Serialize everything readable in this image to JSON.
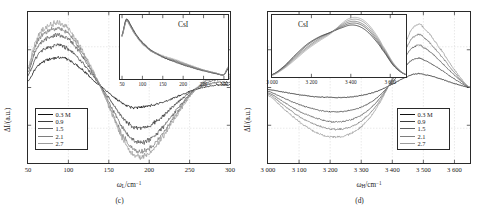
{
  "figure": {
    "panels": [
      {
        "id": "c",
        "caption": "(c)",
        "xlabel_symbol": "ω",
        "xlabel_sub": "L",
        "xlabel_unit": "/cm",
        "xlabel_sup": "−1",
        "ylabel": "ΔI/(a.u.)",
        "xticks": [
          "50",
          "100",
          "150",
          "200",
          "250",
          "300"
        ],
        "xtick_values": [
          50,
          100,
          150,
          200,
          250,
          300
        ],
        "xlim": [
          50,
          300
        ],
        "ylim": [
          -1.15,
          1.15
        ],
        "inset": {
          "title": "CsI",
          "xticks": [
            "50",
            "100",
            "150",
            "200",
            "250",
            "300"
          ],
          "xtick_values": [
            50,
            100,
            150,
            200,
            250,
            300
          ],
          "xlim": [
            45,
            310
          ],
          "ylim": [
            0,
            1.05
          ]
        },
        "legend": {
          "items": [
            {
              "label": "0.3 M",
              "color": "#111111"
            },
            {
              "label": "0.9",
              "color": "#3c3c3c"
            },
            {
              "label": "1.5",
              "color": "#5e5e5e"
            },
            {
              "label": "2.1",
              "color": "#7e7e7e"
            },
            {
              "label": "2.7",
              "color": "#9d9d9d"
            }
          ]
        }
      },
      {
        "id": "d",
        "caption": "(d)",
        "xlabel_symbol": "ω",
        "xlabel_sub": "H",
        "xlabel_unit": "/cm",
        "xlabel_sup": "−1",
        "ylabel": "ΔI/(a.u.)",
        "xticks": [
          "3 000",
          "3 100",
          "3 200",
          "3 300",
          "3 400",
          "3 500",
          "3 600"
        ],
        "xtick_values": [
          3000,
          3100,
          3200,
          3300,
          3400,
          3500,
          3600
        ],
        "xlim": [
          3000,
          3650
        ],
        "ylim": [
          -1.15,
          1.15
        ],
        "inset": {
          "title": "CsI",
          "xticks": [
            "3 000",
            "3 200",
            "3 400",
            "3 600"
          ],
          "xtick_values": [
            3000,
            3200,
            3400,
            3600
          ],
          "xlim": [
            3000,
            3680
          ],
          "ylim": [
            0,
            1.05
          ]
        },
        "legend": {
          "items": [
            {
              "label": "0.3 M",
              "color": "#111111"
            },
            {
              "label": "0.9",
              "color": "#3c3c3c"
            },
            {
              "label": "1.5",
              "color": "#5e5e5e"
            },
            {
              "label": "2.1",
              "color": "#7e7e7e"
            },
            {
              "label": "2.7",
              "color": "#9d9d9d"
            }
          ]
        }
      }
    ]
  },
  "chart_data": [
    {
      "type": "line",
      "panel": "c",
      "title": "",
      "xlabel": "ω_L/cm−1",
      "ylabel": "ΔI/(a.u.)",
      "xlim": [
        50,
        300
      ],
      "ylim": [
        -1.15,
        1.15
      ],
      "grid": true,
      "legend_position": "lower-left",
      "noise_amplitude": 0.035,
      "x": [
        50,
        60,
        70,
        80,
        90,
        100,
        110,
        120,
        130,
        140,
        150,
        160,
        170,
        180,
        190,
        200,
        210,
        220,
        230,
        240,
        250,
        260,
        270,
        280,
        290,
        300
      ],
      "series": [
        {
          "name": "0.3 M",
          "color": "#111111",
          "values": [
            0.1,
            0.3,
            0.4,
            0.44,
            0.46,
            0.42,
            0.34,
            0.24,
            0.12,
            0.02,
            -0.08,
            -0.18,
            -0.26,
            -0.31,
            -0.3,
            -0.28,
            -0.25,
            -0.21,
            -0.16,
            -0.11,
            -0.06,
            -0.02,
            0.01,
            0.03,
            0.04,
            0.04
          ]
        },
        {
          "name": "0.9",
          "color": "#3c3c3c",
          "values": [
            0.18,
            0.46,
            0.58,
            0.62,
            0.64,
            0.58,
            0.48,
            0.34,
            0.18,
            0.02,
            -0.16,
            -0.34,
            -0.5,
            -0.6,
            -0.62,
            -0.58,
            -0.5,
            -0.4,
            -0.29,
            -0.18,
            -0.08,
            -0.01,
            0.04,
            0.07,
            0.08,
            0.08
          ]
        },
        {
          "name": "1.5",
          "color": "#5e5e5e",
          "values": [
            0.24,
            0.58,
            0.72,
            0.78,
            0.8,
            0.73,
            0.6,
            0.42,
            0.22,
            0.02,
            -0.22,
            -0.46,
            -0.66,
            -0.8,
            -0.84,
            -0.8,
            -0.7,
            -0.56,
            -0.4,
            -0.25,
            -0.11,
            0.0,
            0.07,
            0.11,
            0.13,
            0.13
          ]
        },
        {
          "name": "2.1",
          "color": "#7e7e7e",
          "values": [
            0.28,
            0.66,
            0.82,
            0.88,
            0.9,
            0.82,
            0.67,
            0.47,
            0.24,
            0.01,
            -0.26,
            -0.54,
            -0.78,
            -0.94,
            -0.98,
            -0.93,
            -0.81,
            -0.65,
            -0.47,
            -0.29,
            -0.13,
            0.0,
            0.09,
            0.14,
            0.16,
            0.16
          ]
        },
        {
          "name": "2.7",
          "color": "#9d9d9d",
          "values": [
            0.32,
            0.72,
            0.9,
            0.96,
            0.98,
            0.89,
            0.73,
            0.51,
            0.26,
            0.01,
            -0.29,
            -0.59,
            -0.85,
            -1.02,
            -1.06,
            -1.0,
            -0.87,
            -0.7,
            -0.5,
            -0.31,
            -0.14,
            0.01,
            0.11,
            0.17,
            0.19,
            0.19
          ]
        }
      ],
      "inset": {
        "type": "line",
        "title": "CsI",
        "xlim": [
          45,
          310
        ],
        "ylim": [
          0,
          1.05
        ],
        "x": [
          50,
          60,
          70,
          80,
          90,
          100,
          120,
          140,
          160,
          180,
          200,
          220,
          240,
          260,
          280,
          300,
          310
        ],
        "series": [
          {
            "name": "0.3 M",
            "color": "#111111",
            "values": [
              0.72,
              0.98,
              0.9,
              0.78,
              0.68,
              0.6,
              0.48,
              0.4,
              0.33,
              0.28,
              0.23,
              0.19,
              0.15,
              0.12,
              0.09,
              0.07,
              0.16
            ]
          },
          {
            "name": "0.9",
            "color": "#3c3c3c",
            "values": [
              0.72,
              0.97,
              0.89,
              0.77,
              0.67,
              0.59,
              0.47,
              0.39,
              0.33,
              0.29,
              0.24,
              0.2,
              0.16,
              0.12,
              0.09,
              0.07,
              0.17
            ]
          },
          {
            "name": "1.5",
            "color": "#5e5e5e",
            "values": [
              0.71,
              0.96,
              0.88,
              0.76,
              0.66,
              0.58,
              0.47,
              0.4,
              0.34,
              0.3,
              0.25,
              0.21,
              0.16,
              0.13,
              0.09,
              0.07,
              0.18
            ]
          },
          {
            "name": "2.1",
            "color": "#7e7e7e",
            "values": [
              0.71,
              0.95,
              0.87,
              0.75,
              0.66,
              0.58,
              0.46,
              0.4,
              0.35,
              0.31,
              0.26,
              0.21,
              0.17,
              0.13,
              0.1,
              0.07,
              0.19
            ]
          },
          {
            "name": "2.7",
            "color": "#9d9d9d",
            "values": [
              0.7,
              0.94,
              0.86,
              0.75,
              0.65,
              0.57,
              0.46,
              0.41,
              0.36,
              0.32,
              0.27,
              0.22,
              0.17,
              0.13,
              0.1,
              0.07,
              0.2
            ]
          }
        ]
      }
    },
    {
      "type": "line",
      "panel": "d",
      "title": "",
      "xlabel": "ω_H/cm−1",
      "ylabel": "ΔI/(a.u.)",
      "xlim": [
        3000,
        3650
      ],
      "ylim": [
        -1.15,
        1.15
      ],
      "grid": true,
      "legend_position": "lower-right",
      "noise_amplitude": 0.012,
      "x": [
        3000,
        3050,
        3100,
        3150,
        3200,
        3250,
        3300,
        3350,
        3400,
        3450,
        3480,
        3500,
        3550,
        3600,
        3650
      ],
      "series": [
        {
          "name": "0.3 M",
          "color": "#111111",
          "values": [
            -0.03,
            -0.07,
            -0.11,
            -0.14,
            -0.15,
            -0.15,
            -0.12,
            -0.06,
            0.05,
            0.17,
            0.21,
            0.2,
            0.14,
            0.06,
            0.0
          ]
        },
        {
          "name": "0.9",
          "color": "#3c3c3c",
          "values": [
            -0.06,
            -0.16,
            -0.26,
            -0.33,
            -0.37,
            -0.36,
            -0.3,
            -0.16,
            0.08,
            0.36,
            0.44,
            0.42,
            0.29,
            0.13,
            0.0
          ]
        },
        {
          "name": "1.5",
          "color": "#5e5e5e",
          "values": [
            -0.08,
            -0.22,
            -0.36,
            -0.46,
            -0.52,
            -0.51,
            -0.42,
            -0.22,
            0.11,
            0.52,
            0.64,
            0.61,
            0.42,
            0.19,
            0.0
          ]
        },
        {
          "name": "2.1",
          "color": "#7e7e7e",
          "values": [
            -0.1,
            -0.27,
            -0.44,
            -0.56,
            -0.63,
            -0.62,
            -0.51,
            -0.27,
            0.13,
            0.64,
            0.8,
            0.76,
            0.52,
            0.23,
            0.0
          ]
        },
        {
          "name": "2.7",
          "color": "#9d9d9d",
          "values": [
            -0.12,
            -0.32,
            -0.52,
            -0.67,
            -0.75,
            -0.73,
            -0.6,
            -0.31,
            0.15,
            0.76,
            0.96,
            0.91,
            0.62,
            0.27,
            0.0
          ]
        }
      ],
      "inset": {
        "type": "line",
        "title": "CsI",
        "xlim": [
          3000,
          3680
        ],
        "ylim": [
          0,
          1.05
        ],
        "x": [
          3000,
          3060,
          3120,
          3180,
          3240,
          3300,
          3360,
          3400,
          3440,
          3480,
          3520,
          3560,
          3620,
          3680
        ],
        "series": [
          {
            "name": "0.3 M",
            "color": "#111111",
            "values": [
              0.04,
              0.18,
              0.38,
              0.56,
              0.68,
              0.76,
              0.84,
              0.88,
              0.86,
              0.78,
              0.64,
              0.46,
              0.18,
              0.04
            ]
          },
          {
            "name": "0.9",
            "color": "#3c3c3c",
            "values": [
              0.04,
              0.17,
              0.36,
              0.54,
              0.67,
              0.76,
              0.86,
              0.91,
              0.9,
              0.82,
              0.67,
              0.48,
              0.19,
              0.04
            ]
          },
          {
            "name": "1.5",
            "color": "#5e5e5e",
            "values": [
              0.04,
              0.16,
              0.34,
              0.51,
              0.65,
              0.76,
              0.88,
              0.94,
              0.93,
              0.85,
              0.7,
              0.5,
              0.2,
              0.04
            ]
          },
          {
            "name": "2.1",
            "color": "#7e7e7e",
            "values": [
              0.03,
              0.15,
              0.32,
              0.49,
              0.63,
              0.75,
              0.9,
              0.97,
              0.97,
              0.89,
              0.73,
              0.52,
              0.21,
              0.04
            ]
          },
          {
            "name": "2.7",
            "color": "#9d9d9d",
            "values": [
              0.03,
              0.14,
              0.3,
              0.47,
              0.61,
              0.74,
              0.92,
              1.0,
              1.0,
              0.92,
              0.76,
              0.54,
              0.22,
              0.04
            ]
          }
        ]
      }
    }
  ]
}
